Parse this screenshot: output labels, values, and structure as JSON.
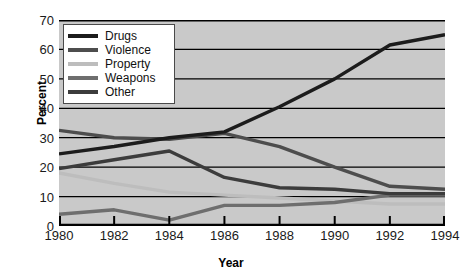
{
  "chart_data": {
    "type": "line",
    "title": "",
    "xlabel": "Year",
    "ylabel": "Percent",
    "x": [
      1980,
      1982,
      1984,
      1986,
      1988,
      1990,
      1992,
      1994
    ],
    "xtick_labels": [
      "1980",
      "1982",
      "1984",
      "1986",
      "1988",
      "1990",
      "1992",
      "1994"
    ],
    "ytick_labels": [
      "0",
      "10",
      "20",
      "30",
      "40",
      "50",
      "60",
      "70"
    ],
    "yticks": [
      0,
      10,
      20,
      30,
      40,
      50,
      60,
      70
    ],
    "xlim": [
      1980,
      1994
    ],
    "ylim": [
      0,
      70
    ],
    "grid": "horizontal",
    "legend_position": "top-left-inside",
    "plot_background": "#c9c9c9",
    "series": [
      {
        "name": "Drugs",
        "color": "#1c1c1c",
        "values": [
          24.5,
          27.0,
          30.0,
          32.0,
          40.5,
          50.0,
          61.5,
          65.0
        ]
      },
      {
        "name": "Violence",
        "color": "#4d4d4d",
        "values": [
          32.5,
          30.0,
          29.5,
          31.5,
          27.0,
          20.0,
          13.5,
          12.5
        ]
      },
      {
        "name": "Property",
        "color": "#bdbdbd",
        "values": [
          18.0,
          14.5,
          11.5,
          10.5,
          9.5,
          8.5,
          7.5,
          7.5
        ]
      },
      {
        "name": "Weapons",
        "color": "#6e6e6e",
        "values": [
          4.0,
          5.5,
          2.0,
          7.0,
          7.0,
          8.0,
          10.5,
          10.5
        ]
      },
      {
        "name": "Other",
        "color": "#3c3c3c",
        "values": [
          19.5,
          22.5,
          25.5,
          16.5,
          13.0,
          12.5,
          11.0,
          11.0
        ]
      }
    ]
  },
  "legend": {
    "items": [
      {
        "label": "Drugs"
      },
      {
        "label": "Violence"
      },
      {
        "label": "Property"
      },
      {
        "label": "Weapons"
      },
      {
        "label": "Other"
      }
    ]
  },
  "axes": {
    "y_title": "Percent",
    "x_title": "Year"
  }
}
